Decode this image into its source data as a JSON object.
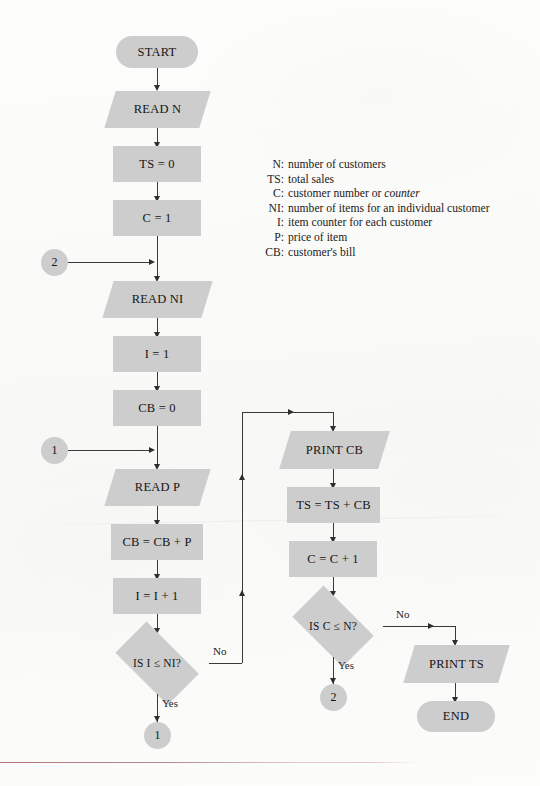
{
  "figure": {
    "type": "flowchart",
    "shape_fill": "#cdcdcd",
    "line_color": "#3a3a3a",
    "background": "#fbfbf9"
  },
  "legend": {
    "entries": [
      {
        "key": "N:",
        "text": "number of customers"
      },
      {
        "key": "TS:",
        "text": "total sales"
      },
      {
        "key": "C:",
        "text_before": "customer number or ",
        "italic": "counter",
        "text_after": ""
      },
      {
        "key": "NI:",
        "text": "number of items for an individual customer"
      },
      {
        "key": "I:",
        "text": "item counter for each customer"
      },
      {
        "key": "P:",
        "text": "price of item"
      },
      {
        "key": "CB:",
        "text": "customer's bill"
      }
    ]
  },
  "nodes": {
    "start": "START",
    "read_n": "READ N",
    "ts_init": "TS = 0",
    "c_init": "C = 1",
    "connector_2_in": "2",
    "read_ni": "READ NI",
    "i_init": "I = 1",
    "cb_init": "CB = 0",
    "connector_1_in": "1",
    "read_p": "READ P",
    "cb_accum": "CB = CB + P",
    "i_incr": "I = I + 1",
    "decision_items": "IS I  ≤  NI?",
    "connector_1_out": "1",
    "print_cb": "PRINT CB",
    "ts_accum": "TS = TS + CB",
    "c_incr": "C = C + 1",
    "decision_customers": "IS C  ≤  N?",
    "connector_2_out": "2",
    "print_ts": "PRINT TS",
    "end": "END"
  },
  "edge_labels": {
    "items_no": "No",
    "items_yes": "Yes",
    "customers_no": "No",
    "customers_yes": "Yes"
  }
}
